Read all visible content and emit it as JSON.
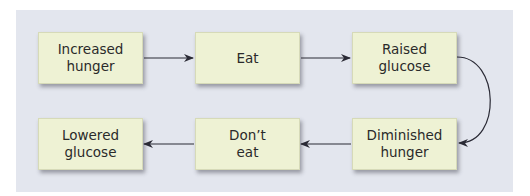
{
  "diagram": {
    "type": "flowchart",
    "nodes": [
      {
        "id": "increased-hunger",
        "label": "Increased\nhunger"
      },
      {
        "id": "eat",
        "label": "Eat"
      },
      {
        "id": "raised-glucose",
        "label": "Raised\nglucose"
      },
      {
        "id": "diminished-hunger",
        "label": "Diminished\nhunger"
      },
      {
        "id": "dont-eat",
        "label": "Don’t\neat"
      },
      {
        "id": "lowered-glucose",
        "label": "Lowered\nglucose"
      }
    ],
    "edges": [
      {
        "from": "increased-hunger",
        "to": "eat"
      },
      {
        "from": "eat",
        "to": "raised-glucose"
      },
      {
        "from": "raised-glucose",
        "to": "diminished-hunger"
      },
      {
        "from": "diminished-hunger",
        "to": "dont-eat"
      },
      {
        "from": "dont-eat",
        "to": "lowered-glucose"
      }
    ],
    "colors": {
      "panel": "#e3e6ee",
      "box_fill": "#eef2d4",
      "arrow": "#2a2a35"
    }
  }
}
